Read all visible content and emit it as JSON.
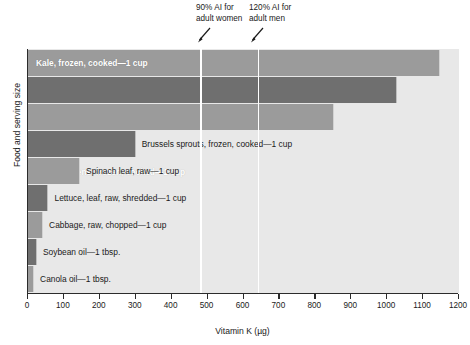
{
  "chart_data": {
    "type": "bar",
    "orientation": "horizontal",
    "title": "",
    "xlabel": "Vitamin K (µg)",
    "ylabel": "Food and serving size",
    "xlim": [
      0,
      1200
    ],
    "xticks": [
      0,
      100,
      200,
      300,
      400,
      500,
      600,
      700,
      800,
      900,
      1000,
      1100,
      1200
    ],
    "grid": false,
    "legend": "none",
    "categories": [
      "Kale, frozen, cooked—1 cup",
      "Spinach, frozen, cooked—1 cup",
      "Turnip greens, frozen, cooked—1 cup",
      "Brussels sprouts, frozen, cooked—1 cup",
      "Spinach leaf, raw—1 cup",
      "Lettuce, leaf, raw, shredded—1 cup",
      "Cabbage, raw, chopped—1 cup",
      "Soybean oil—1 tbsp.",
      "Canola oil—1 tbsp."
    ],
    "values": [
      1147,
      1027,
      851,
      300,
      145,
      57,
      42,
      25,
      17
    ],
    "bar_colors": [
      "#9b9b9b",
      "#6f6f6f",
      "#9b9b9b",
      "#6f6f6f",
      "#9b9b9b",
      "#6f6f6f",
      "#9b9b9b",
      "#6f6f6f",
      "#9b9b9b"
    ],
    "label_inside": [
      true,
      true,
      true,
      false,
      false,
      false,
      false,
      false,
      false
    ],
    "plot_background": "#e8e8e8",
    "annotations": [
      {
        "text": "90% AI for\nadult women",
        "value": 480,
        "line_color": "#ffffff"
      },
      {
        "text": "120% AI for\nadult men",
        "value": 640,
        "line_color": "#ffffff"
      }
    ]
  },
  "axis": {
    "x_title": "Vitamin K (µg)",
    "y_title": "Food and serving size",
    "x_tick_labels": [
      "0",
      "100",
      "200",
      "300",
      "400",
      "500",
      "600",
      "700",
      "800",
      "900",
      "1000",
      "1100",
      "1200"
    ]
  },
  "annotations": {
    "women": {
      "label": "90% AI for\nadult women",
      "icon": "down-left-arrow-icon"
    },
    "men": {
      "label": "120% AI for\nadult men",
      "icon": "down-left-arrow-icon"
    }
  }
}
